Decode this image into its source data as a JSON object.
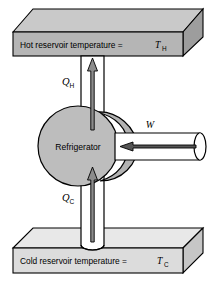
{
  "figure": {
    "type": "thermodynamic-refrigerator-schematic",
    "background_color": "#ffffff"
  },
  "hot_reservoir": {
    "name": "hot-reservoir-slab",
    "label_text": "Hot reservoir temperature  =",
    "symbol": "T",
    "symbol_subscript": "H",
    "full_label": "Hot reservoir temperature = T_H",
    "front_face_color": "#b5b5b5",
    "top_face_color": "#c9c9c9",
    "side_face_color": "#9d9d9d",
    "outline_color": "#000000"
  },
  "cold_reservoir": {
    "name": "cold-reservoir-slab",
    "label_text": "Cold reservoir temperature  =",
    "symbol": "T",
    "symbol_subscript": "C",
    "full_label": "Cold reservoir temperature = T_C",
    "front_face_color": "#dcdcdc",
    "top_face_color": "#e8e8e8",
    "side_face_color": "#c6c6c6",
    "outline_color": "#000000"
  },
  "engine": {
    "name": "refrigerator-body",
    "label": "Refrigerator",
    "fill_color": "#bdbdbd",
    "body_fill_color": "#b2b2b2",
    "outline_color": "#000000"
  },
  "heat_in": {
    "name": "heat-absorbed-cold",
    "symbol": "Q",
    "subscript": "C",
    "full_label": "Q_C",
    "direction": "up",
    "description": "Heat absorbed from cold reservoir, flows upward into refrigerator",
    "pipe_fill": "#ffffff",
    "arrow_fill": "#8c8c8c",
    "arrow_outline": "#000000"
  },
  "heat_out": {
    "name": "heat-rejected-hot",
    "symbol": "Q",
    "subscript": "H",
    "full_label": "Q_H",
    "direction": "up",
    "description": "Heat rejected to hot reservoir, flows upward out of refrigerator",
    "pipe_fill": "#ffffff",
    "arrow_fill": "#8c8c8c",
    "arrow_outline": "#000000"
  },
  "work_in": {
    "name": "work-input",
    "symbol": "W",
    "full_label": "W",
    "direction": "left",
    "description": "Work input supplied to the refrigerator, arrow points left into the body",
    "tube_fill": "#ffffff",
    "arrow_fill": "#555555",
    "arrow_outline": "#000000"
  }
}
